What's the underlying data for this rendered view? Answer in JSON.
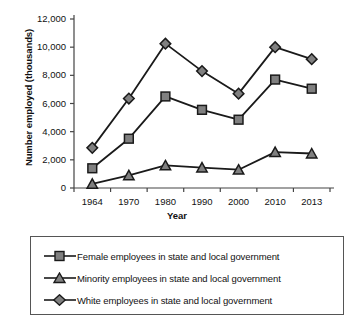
{
  "chart_data": {
    "type": "line",
    "title": "",
    "xlabel": "Year",
    "ylabel": "Number employed (thousands)",
    "categories": [
      "1964",
      "1970",
      "1980",
      "1990",
      "2000",
      "2010",
      "2013"
    ],
    "ylim": [
      0,
      12000
    ],
    "yticks": [
      "0",
      "2,000",
      "4,000",
      "6,000",
      "8,000",
      "10,000",
      "12,000"
    ],
    "ytick_values": [
      0,
      2000,
      4000,
      6000,
      8000,
      10000,
      12000
    ],
    "grid": false,
    "legend_position": "below-plot",
    "series": [
      {
        "name": "Female employees in state and local government",
        "marker": "square",
        "values": [
          1400,
          3500,
          6500,
          5550,
          4850,
          7700,
          7050
        ]
      },
      {
        "name": "Minority employees in state and local government",
        "marker": "triangle",
        "values": [
          300,
          900,
          1600,
          1450,
          1300,
          2550,
          2450
        ]
      },
      {
        "name": "White employees in state and local government",
        "marker": "diamond",
        "values": [
          2850,
          6350,
          10250,
          8300,
          6700,
          10000,
          9150
        ]
      }
    ],
    "colors": {
      "line": "#1a1a1a",
      "marker_fill": "#808080",
      "marker_stroke": "#1a1a1a",
      "axis": "#444444",
      "text": "#111111",
      "legend_border": "#555555"
    }
  }
}
